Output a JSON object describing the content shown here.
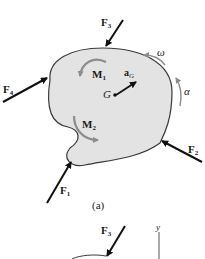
{
  "figure_a": {
    "caption": "(a)",
    "body_fill": "#e3e3e3",
    "body_stroke": "#3a3a3a",
    "forces": [
      {
        "id": "F1",
        "label": "F",
        "sub": "1"
      },
      {
        "id": "F2",
        "label": "F",
        "sub": "2"
      },
      {
        "id": "F3",
        "label": "F",
        "sub": "3"
      },
      {
        "id": "F4",
        "label": "F",
        "sub": "4"
      }
    ],
    "moments": [
      {
        "id": "M1",
        "label": "M",
        "sub": "1"
      },
      {
        "id": "M2",
        "label": "M",
        "sub": "2"
      }
    ],
    "center_of_mass": {
      "label": "G"
    },
    "acceleration": {
      "label": "a",
      "sub": "G"
    },
    "angular_velocity": {
      "label": "ω"
    },
    "angular_acceleration": {
      "label": "α"
    },
    "arrow_color": "#111111",
    "moment_arrow_color": "#8c8c8c"
  },
  "figure_b_partial": {
    "forces": [
      {
        "id": "F3",
        "label": "F",
        "sub": "3"
      }
    ],
    "axis": {
      "label": "y"
    }
  }
}
